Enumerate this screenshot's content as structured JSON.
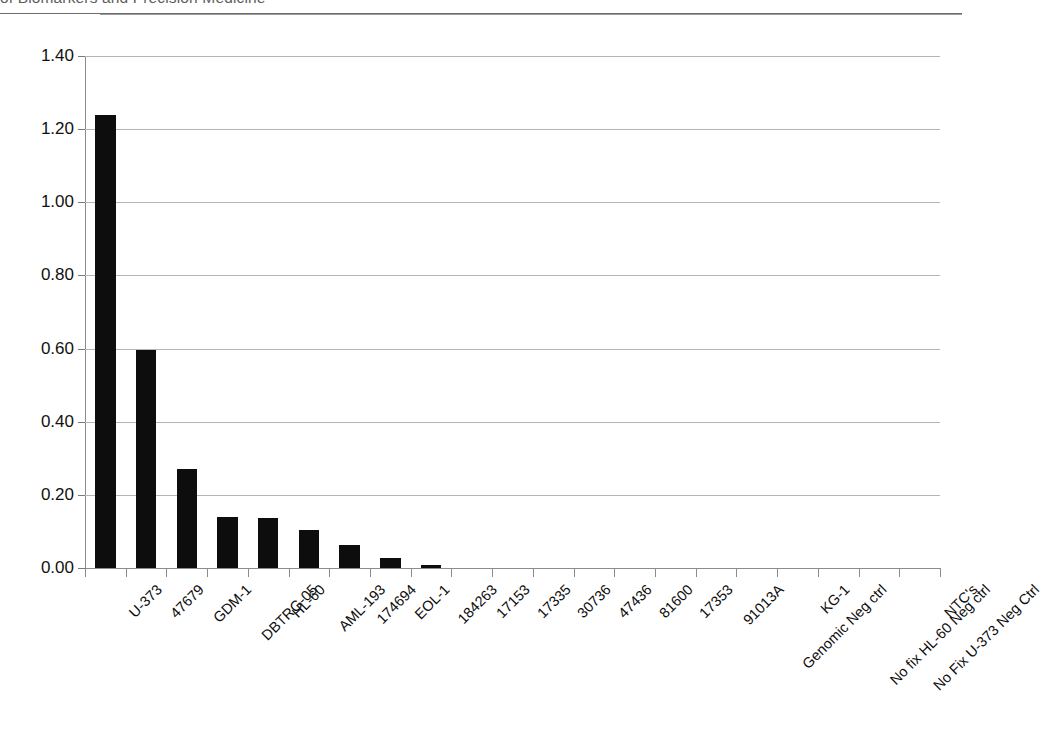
{
  "page": {
    "header_text": "of Biomarkers and Precision Medicine"
  },
  "chart_data": {
    "type": "bar",
    "title": "",
    "subtitle": "",
    "xlabel": "",
    "ylabel": "",
    "grid": true,
    "legend": "none",
    "ylim": [
      0.0,
      1.4
    ],
    "ytick_labels": [
      "1.40",
      "1.20",
      "1.00",
      "0.80",
      "0.60",
      "0.40",
      "0.20",
      "0.00"
    ],
    "ytick_values": [
      1.4,
      1.2,
      1.0,
      0.8,
      0.6,
      0.4,
      0.2,
      0.0
    ],
    "bar_color": "#0d0d0d",
    "gridline_color": "#b4b4b4",
    "axis_color": "#8c8c8c",
    "categories": [
      "U-373",
      "47679",
      "GDM-1",
      "DBTRG-05",
      "HL-60",
      "AML-193",
      "174694",
      "EOL-1",
      "184263",
      "17153",
      "17335",
      "30736",
      "47436",
      "81600",
      "17353",
      "91013A",
      "Genomic Neg ctrl",
      "KG-1",
      "No fix HL-60 Neg ctrl",
      "No Fix U-373 Neg Ctrl",
      "NTC's"
    ],
    "values": [
      1.24,
      0.595,
      0.27,
      0.14,
      0.137,
      0.105,
      0.063,
      0.027,
      0.009,
      0.0,
      0.0,
      0.0,
      0.0,
      0.0,
      0.0,
      0.0,
      0.0,
      0.0,
      0.0,
      0.0,
      0.0
    ]
  }
}
